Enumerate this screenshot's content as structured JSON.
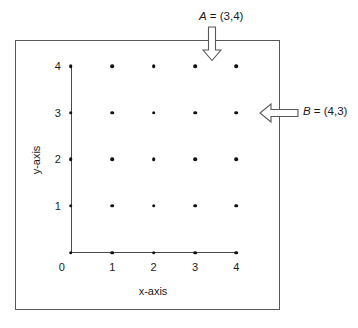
{
  "figure": {
    "type": "coordinate-lattice-diagram",
    "frame_color": "#58585a",
    "axis_color": "#4a4a4c",
    "dot_color": "#111111"
  },
  "axes": {
    "x_title": "x-axis",
    "y_title": "y-axis",
    "x_ticks": [
      "0",
      "1",
      "2",
      "3",
      "4"
    ],
    "y_ticks": [
      "0",
      "1",
      "2",
      "3",
      "4"
    ],
    "origin_label": "0"
  },
  "chart_data": {
    "type": "scatter",
    "title": "",
    "xlabel": "x-axis",
    "ylabel": "y-axis",
    "xlim": [
      0,
      4
    ],
    "ylim": [
      0,
      4
    ],
    "xticks": [
      0,
      1,
      2,
      3,
      4
    ],
    "yticks": [
      0,
      1,
      2,
      3,
      4
    ],
    "grid": false,
    "legend": "none",
    "points": [
      {
        "x": 0,
        "y": 1
      },
      {
        "x": 1,
        "y": 1
      },
      {
        "x": 2,
        "y": 1
      },
      {
        "x": 3,
        "y": 1
      },
      {
        "x": 4,
        "y": 1
      },
      {
        "x": 0,
        "y": 2
      },
      {
        "x": 1,
        "y": 2
      },
      {
        "x": 2,
        "y": 2
      },
      {
        "x": 3,
        "y": 2
      },
      {
        "x": 4,
        "y": 2
      },
      {
        "x": 0,
        "y": 3
      },
      {
        "x": 1,
        "y": 3
      },
      {
        "x": 2,
        "y": 3
      },
      {
        "x": 3,
        "y": 3
      },
      {
        "x": 4,
        "y": 3
      },
      {
        "x": 0,
        "y": 4
      },
      {
        "x": 1,
        "y": 4
      },
      {
        "x": 2,
        "y": 4
      },
      {
        "x": 3,
        "y": 4
      },
      {
        "x": 4,
        "y": 4
      },
      {
        "x": 0,
        "y": 0
      },
      {
        "x": 1,
        "y": 0
      },
      {
        "x": 2,
        "y": 0
      },
      {
        "x": 3,
        "y": 0
      },
      {
        "x": 4,
        "y": 0
      }
    ],
    "annotations": [
      {
        "name": "A",
        "text": "A = (3,4)",
        "point": [
          3,
          4
        ],
        "arrow": "down"
      },
      {
        "name": "B",
        "text": "B = (4,3)",
        "point": [
          4,
          3
        ],
        "arrow": "left"
      }
    ]
  },
  "annotations": {
    "a": {
      "symbol": "A",
      "equals": " = ",
      "value": "(3,4)",
      "full": "A = (3,4)"
    },
    "b": {
      "symbol": "B",
      "equals": "  = ",
      "value": "(4,3)",
      "full": "B = (4,3)"
    }
  }
}
